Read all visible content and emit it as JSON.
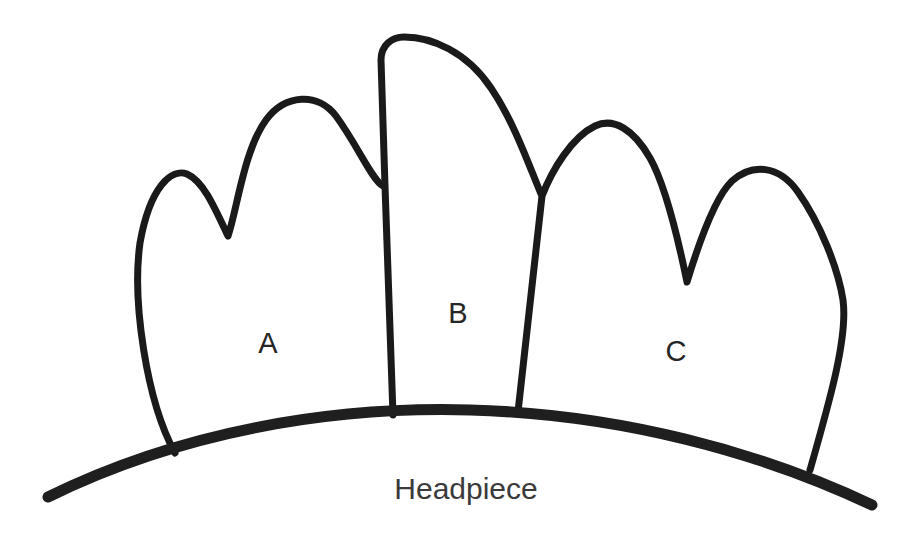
{
  "diagram": {
    "background_color": "#ffffff",
    "ink_color": "#1a1a1a",
    "caption": {
      "text": "Headpiece",
      "x": 466,
      "y": 491,
      "color": "#3a3a3a"
    },
    "labels": [
      {
        "id": "label-a",
        "text": "A",
        "x": 268,
        "y": 345,
        "color": "#262626"
      },
      {
        "id": "label-b",
        "text": "B",
        "x": 458,
        "y": 315,
        "color": "#262626"
      },
      {
        "id": "label-c",
        "text": "C",
        "x": 676,
        "y": 353,
        "color": "#262626"
      }
    ],
    "shapes": {
      "lobe_a": {
        "name": "lobe-a-outline",
        "description": "Leftmost lobe with two rounded peaks and a V-notch between them",
        "path": "M 175 453 C 146 400 132 300 140 243 C 150 186 172 168 187 174 C 203 181 214 206 228 236 C 237 210 244 150 266 120 C 285 94 318 92 336 116 C 358 146 372 180 383 186 L 383 186"
      },
      "lobe_b": {
        "name": "lobe-b-outline",
        "description": "Centre lobe, tall with a flat-topped rounded crown",
        "path": "M 393 415 L 385 186 L 381 60 C 381 45 392 37 404 37 C 432 37 467 52 491 88 C 514 122 528 163 541 194"
      },
      "lobe_c": {
        "name": "lobe-c-outline",
        "description": "Rightmost lobe with two rounded peaks and a V-notch between them",
        "path": "M 518 412 L 542 196 C 552 170 572 137 595 126 C 614 117 634 130 650 158 C 667 188 680 248 687 282 C 697 249 714 198 732 181 C 752 163 779 165 798 192 C 820 223 838 268 843 300 C 848 337 830 400 810 470"
      },
      "headpiece_arc": {
        "name": "headpiece-arc",
        "description": "Wide shallow arc forming the base band of the headpiece",
        "path": "M 48 497 C 180 432 330 406 470 410 C 620 414 760 452 872 505"
      }
    },
    "junctions": [
      {
        "name": "notch-lobe-a",
        "x": 230,
        "y": 238
      },
      {
        "name": "junction-a-b",
        "x": 384,
        "y": 186
      },
      {
        "name": "junction-b-c",
        "x": 542,
        "y": 195
      },
      {
        "name": "notch-lobe-c",
        "x": 687,
        "y": 283
      },
      {
        "name": "base-lobe-a",
        "x": 175,
        "y": 453
      },
      {
        "name": "base-lobe-b-left",
        "x": 393,
        "y": 415
      },
      {
        "name": "base-lobe-b-right",
        "x": 518,
        "y": 412
      },
      {
        "name": "base-lobe-c",
        "x": 810,
        "y": 470
      }
    ]
  }
}
